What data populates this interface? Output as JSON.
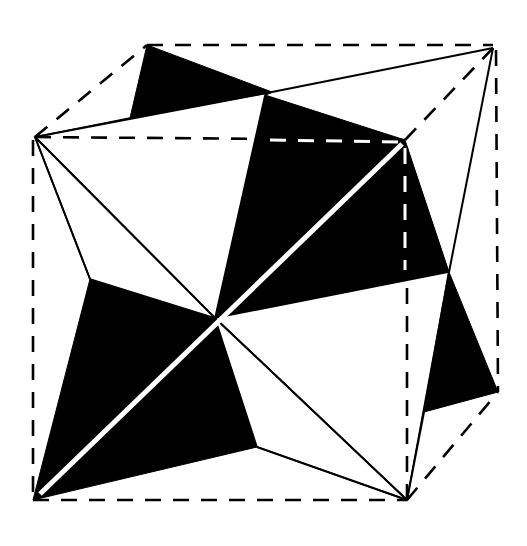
{
  "figure": {
    "title": "",
    "colors": {
      "ink": "#000000",
      "paper": "#ffffff"
    },
    "cube_style": "dashed",
    "face_pattern": "alternating black and white triangles"
  }
}
